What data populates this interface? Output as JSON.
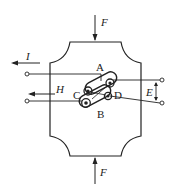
{
  "diagram": {
    "type": "hall-effect-sample",
    "labels": {
      "force_top": "F",
      "force_bottom": "F",
      "current": "I",
      "field": "H",
      "emf": "E",
      "point_a": "A",
      "point_b": "B",
      "point_c": "C",
      "point_d": "D"
    },
    "colors": {
      "line": "#222222",
      "background": "#ffffff"
    }
  }
}
